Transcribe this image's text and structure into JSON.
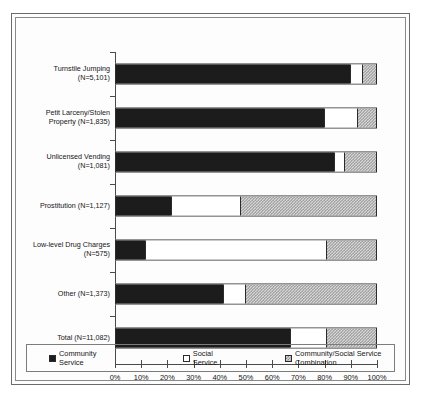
{
  "chart_data": {
    "type": "bar",
    "orientation": "horizontal",
    "stacked": true,
    "normalized_percent": true,
    "title": "",
    "subtitle": "",
    "xlabel": "",
    "ylabel": "",
    "xlim": [
      0,
      100
    ],
    "grid": false,
    "legend_position": "bottom",
    "tick_labels": [
      "0%",
      "10%",
      "20%",
      "30%",
      "40%",
      "50%",
      "60%",
      "70%",
      "80%",
      "90%",
      "100%"
    ],
    "tick_values": [
      0,
      10,
      20,
      30,
      40,
      50,
      60,
      70,
      80,
      90,
      100
    ],
    "categories": [
      "Turnstile Jumping\n(N=5,101)",
      "Petit Larceny/Stolen\nProperty (N=1,835)",
      "Unlicensed Vending\n(N=1,081)",
      "Prostitution (N=1,127)",
      "Low-level Drug Charges\n(N=575)",
      "Other (N=1,373)",
      "Total (N=11,082)"
    ],
    "series": [
      {
        "name": "Community Service",
        "color": "#1c1c1c",
        "values": [
          90,
          80,
          84,
          21,
          11,
          41,
          67
        ]
      },
      {
        "name": "Social Service",
        "color": "#ffffff",
        "values": [
          5,
          13,
          4,
          27,
          70,
          9,
          14
        ]
      },
      {
        "name": "Community/Social Service Combination",
        "color": "#d7d7d7",
        "values": [
          5,
          7,
          12,
          52,
          19,
          50,
          19
        ]
      }
    ],
    "legend": [
      {
        "label": "Community Service",
        "swatch": "community-swatch"
      },
      {
        "label": "Social Service",
        "swatch": "social-swatch"
      },
      {
        "label": "Community/Social Service Combination",
        "swatch": "combo-swatch"
      }
    ]
  }
}
